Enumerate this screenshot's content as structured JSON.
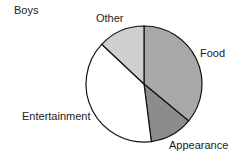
{
  "chart_data": {
    "type": "pie",
    "title": "Boys",
    "start_angle_deg": 90,
    "direction": "clockwise",
    "categories": [
      "Food",
      "Appearance",
      "Entertainment",
      "Other"
    ],
    "values": [
      36,
      12,
      39,
      13
    ],
    "unit": "percent (estimated from slice angles)",
    "colors": [
      "#a8a8a8",
      "#8c8c8c",
      "#ffffff",
      "#cfcfcf"
    ],
    "legend": "none (direct labels)"
  },
  "labels": {
    "title": "Boys",
    "food": "Food",
    "appearance": "Appearance",
    "entertainment": "Entertainment",
    "other": "Other"
  }
}
